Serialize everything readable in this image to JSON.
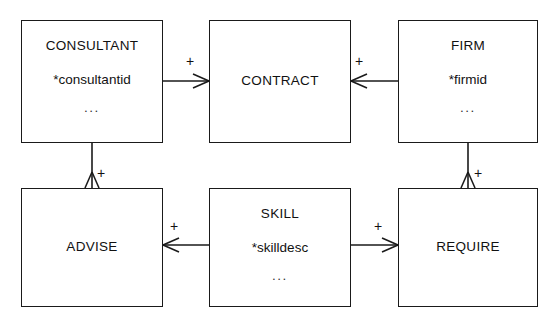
{
  "diagram": {
    "type": "entity-relationship-diagram",
    "notation": "crows-foot",
    "background_color": "#ffffff",
    "line_color": "#1a1a1a",
    "text_color": "#111111",
    "width": 556,
    "height": 328,
    "entities": [
      {
        "id": "consultant",
        "name": "CONSULTANT",
        "key": "*consultantid",
        "ellipsis": "...",
        "x": 21,
        "y": 20,
        "w": 142,
        "h": 123
      },
      {
        "id": "contract",
        "name": "CONTRACT",
        "key": "",
        "ellipsis": "",
        "x": 209,
        "y": 20,
        "w": 142,
        "h": 123
      },
      {
        "id": "firm",
        "name": "FIRM",
        "key": "*firmid",
        "ellipsis": "...",
        "x": 398,
        "y": 20,
        "w": 140,
        "h": 123
      },
      {
        "id": "advise",
        "name": "ADVISE",
        "key": "",
        "ellipsis": "",
        "x": 21,
        "y": 188,
        "w": 142,
        "h": 119
      },
      {
        "id": "skill",
        "name": "SKILL",
        "key": "*skilldesc",
        "ellipsis": "...",
        "x": 209,
        "y": 188,
        "w": 142,
        "h": 119
      },
      {
        "id": "require",
        "name": "REQUIRE",
        "key": "",
        "ellipsis": "",
        "x": 398,
        "y": 188,
        "w": 140,
        "h": 119
      }
    ],
    "relationships": [
      {
        "id": "consultant-contract",
        "from": "consultant",
        "to": "contract",
        "cardinality_label": "+",
        "label_x": 267,
        "label_y": 61,
        "crowsfoot_at": "contract-left",
        "direction": "left"
      },
      {
        "id": "contract-firm",
        "from": "contract",
        "to": "firm",
        "cardinality_label": "+",
        "label_x": 366,
        "label_y": 61,
        "crowsfoot_at": "contract-right",
        "direction": "right"
      },
      {
        "id": "consultant-advise",
        "from": "consultant",
        "to": "advise",
        "cardinality_label": "+",
        "label_x": 98,
        "label_y": 164,
        "crowsfoot_at": "advise-top",
        "direction": "up"
      },
      {
        "id": "advise-skill",
        "from": "advise",
        "to": "skill",
        "cardinality_label": "+",
        "label_x": 174,
        "label_y": 228,
        "crowsfoot_at": "advise-right",
        "direction": "right"
      },
      {
        "id": "skill-require",
        "from": "skill",
        "to": "require",
        "cardinality_label": "+",
        "label_x": 383,
        "label_y": 228,
        "crowsfoot_at": "require-left",
        "direction": "left"
      },
      {
        "id": "firm-require",
        "from": "firm",
        "to": "require",
        "cardinality_label": "+",
        "label_x": 479,
        "label_y": 164,
        "crowsfoot_at": "require-top",
        "direction": "up"
      }
    ]
  }
}
